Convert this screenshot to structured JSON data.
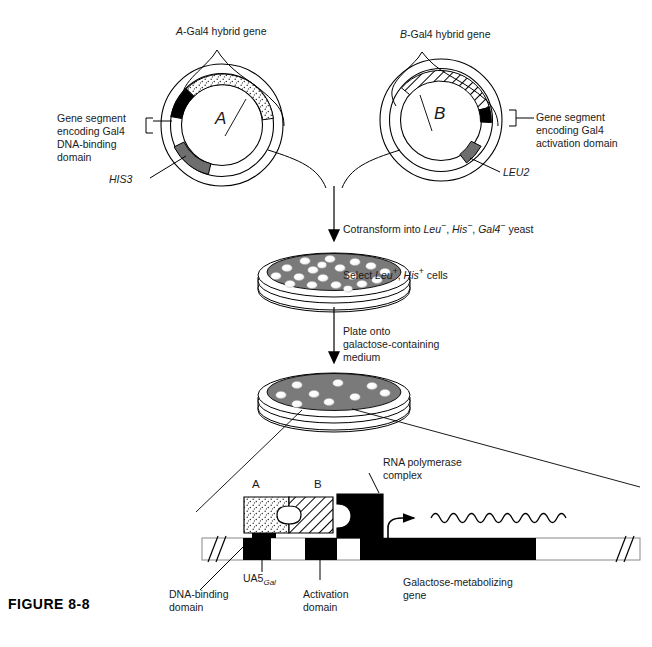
{
  "figure": {
    "caption": "FIGURE 8-8"
  },
  "plasmid_a": {
    "title_prefix": "A",
    "title_rest": "-Gal4 hybrid gene",
    "center_letter": "A",
    "marker_label": "HIS3",
    "segment_label_line1": "Gene segment",
    "segment_label_line2": "encoding Gal4",
    "segment_label_line3": "DNA-binding",
    "segment_label_line4": "domain",
    "segments": [
      {
        "name": "A-insert",
        "fill": "stipple"
      },
      {
        "name": "gal4-dna-binding-domain",
        "fill": "black"
      },
      {
        "name": "HIS3",
        "fill": "gray"
      }
    ]
  },
  "plasmid_b": {
    "title_prefix": "B",
    "title_rest": "-Gal4 hybrid gene",
    "center_letter": "B",
    "marker_label": "LEU2",
    "segment_label_line1": "Gene segment",
    "segment_label_line2": "encoding Gal4",
    "segment_label_line3": "activation domain",
    "segments": [
      {
        "name": "B-insert",
        "fill": "hatch"
      },
      {
        "name": "gal4-activation-domain",
        "fill": "black"
      },
      {
        "name": "LEU2",
        "fill": "gray"
      }
    ]
  },
  "step_cotransform": {
    "line1_a": "Cotransform into ",
    "line1_leu": "Leu",
    "line1_leu_sup": "−",
    "line1_b": ", ",
    "line1_his": "His",
    "line1_his_sup": "−",
    "line1_c": ", ",
    "line1_gal": "Gal4",
    "line1_gal_sup": "−",
    "line1_d": " yeast",
    "line2_a": "Select ",
    "line2_leu": "Leu",
    "line2_leu_sup": "+",
    "line2_b": ", ",
    "line2_his": "His",
    "line2_his_sup": "+",
    "line2_c": " cells"
  },
  "step_plate": {
    "line1": "Plate onto",
    "line2": "galactose-containing",
    "line3": "medium"
  },
  "dish_top": {
    "name": "selection-plate",
    "colony_count": 19
  },
  "dish_bottom": {
    "name": "galactose-plate",
    "colony_count": 9
  },
  "detail": {
    "protein_a_label": "A",
    "protein_b_label": "B",
    "rna_pol_line1": "RNA polymerase",
    "rna_pol_line2": "complex",
    "dna_binding_line1": "DNA-binding",
    "dna_binding_line2": "domain",
    "uas_main": "UA5",
    "uas_sub": "Gal",
    "activation_line1": "Activation",
    "activation_line2": "domain",
    "gene_line1": "Galactose-metabolizing",
    "gene_line2": "gene"
  },
  "colors": {
    "ink": "#000000",
    "text": "#1a1a1a",
    "medium_gray": "#7a7a7a",
    "segment_gray": "#6e6e6e",
    "colony_white": "#ffffff",
    "stipple_bg": "#f2f2f2"
  }
}
